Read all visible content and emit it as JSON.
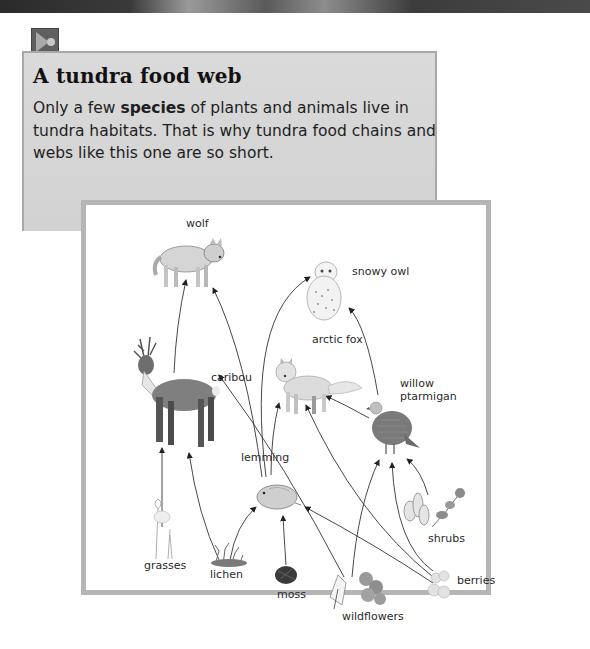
{
  "header": {
    "media_icon": "play-audio-icon"
  },
  "intro": {
    "title": "A tundra food web",
    "text_before": "Only a few ",
    "text_bold": "species",
    "text_after": " of plants and animals live in tundra habitats. That is why tundra food chains and webs like this one are so short."
  },
  "food_web": {
    "organisms": {
      "wolf": "wolf",
      "snowy_owl": "snowy owl",
      "caribou": "caribou",
      "arctic_fox": "arctic fox",
      "willow_ptarmigan_line1": "willow",
      "willow_ptarmigan_line2": "ptarmigan",
      "lemming": "lemming",
      "grasses": "grasses",
      "lichen": "lichen",
      "moss": "moss",
      "wildflowers": "wildflowers",
      "shrubs": "shrubs",
      "berries": "berries"
    },
    "links": [
      {
        "from": "grasses",
        "to": "caribou"
      },
      {
        "from": "lichen",
        "to": "caribou"
      },
      {
        "from": "lichen",
        "to": "lemming"
      },
      {
        "from": "moss",
        "to": "lemming"
      },
      {
        "from": "wildflowers",
        "to": "caribou"
      },
      {
        "from": "wildflowers",
        "to": "willow ptarmigan"
      },
      {
        "from": "berries",
        "to": "lemming"
      },
      {
        "from": "berries",
        "to": "arctic fox"
      },
      {
        "from": "berries",
        "to": "willow ptarmigan"
      },
      {
        "from": "shrubs",
        "to": "willow ptarmigan"
      },
      {
        "from": "caribou",
        "to": "wolf"
      },
      {
        "from": "lemming",
        "to": "wolf"
      },
      {
        "from": "lemming",
        "to": "snowy owl"
      },
      {
        "from": "lemming",
        "to": "arctic fox"
      },
      {
        "from": "willow ptarmigan",
        "to": "arctic fox"
      },
      {
        "from": "willow ptarmigan",
        "to": "snowy owl"
      }
    ]
  }
}
